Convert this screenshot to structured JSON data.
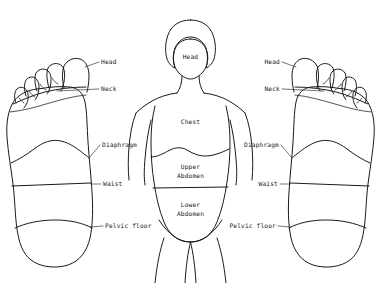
{
  "diagram": {
    "background_color": "#ffffff",
    "line_color": "#1a1a1a",
    "width": 381,
    "height": 283
  },
  "left_foot": {
    "name": "left-foot-sole",
    "labels": [
      {
        "id": "head",
        "text": "Head",
        "align": "left"
      },
      {
        "id": "neck",
        "text": "Neck",
        "align": "left"
      },
      {
        "id": "diaphragm",
        "text": "Diaphragm",
        "align": "left"
      },
      {
        "id": "waist",
        "text": "Waist",
        "align": "left"
      },
      {
        "id": "pelvic_floor",
        "text": "Pelvic floor",
        "align": "left"
      }
    ]
  },
  "right_foot": {
    "name": "right-foot-sole",
    "labels": [
      {
        "id": "head",
        "text": "Head",
        "align": "right"
      },
      {
        "id": "neck",
        "text": "Neck",
        "align": "right"
      },
      {
        "id": "diaphragm",
        "text": "Diaphragm",
        "align": "right"
      },
      {
        "id": "waist",
        "text": "Waist",
        "align": "right"
      },
      {
        "id": "pelvic_floor",
        "text": "Pelvic floor",
        "align": "right"
      }
    ]
  },
  "body_figure": {
    "name": "human-torso-figure",
    "regions": [
      {
        "id": "head",
        "text": "Head"
      },
      {
        "id": "chest",
        "text": "Chest"
      },
      {
        "id": "upper_abdomen",
        "line1": "Upper",
        "line2": "Abdomen"
      },
      {
        "id": "lower_abdomen",
        "line1": "Lower",
        "line2": "Abdomen"
      }
    ]
  }
}
